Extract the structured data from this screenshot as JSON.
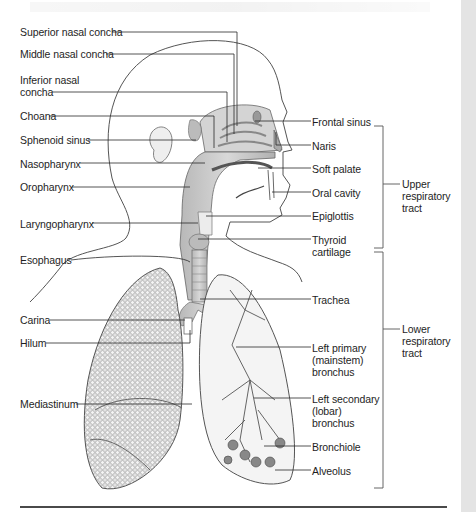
{
  "figure": {
    "left_labels": [
      {
        "id": "superior-nasal-concha",
        "text": "Superior nasal concha",
        "x": 20,
        "y": 26
      },
      {
        "id": "middle-nasal-concha",
        "text": "Middle nasal concha",
        "x": 20,
        "y": 48
      },
      {
        "id": "inferior-nasal-concha",
        "text": "Inferior nasal\nconcha",
        "x": 20,
        "y": 74
      },
      {
        "id": "choana",
        "text": "Choana",
        "x": 20,
        "y": 110
      },
      {
        "id": "sphenoid-sinus",
        "text": "Sphenoid sinus",
        "x": 20,
        "y": 134
      },
      {
        "id": "nasopharynx",
        "text": "Nasopharynx",
        "x": 20,
        "y": 158
      },
      {
        "id": "oropharynx",
        "text": "Oropharynx",
        "x": 20,
        "y": 181
      },
      {
        "id": "laryngopharynx",
        "text": "Laryngopharynx",
        "x": 20,
        "y": 218
      },
      {
        "id": "esophagus",
        "text": "Esophagus",
        "x": 20,
        "y": 254
      },
      {
        "id": "carina",
        "text": "Carina",
        "x": 20,
        "y": 314
      },
      {
        "id": "hilum",
        "text": "Hilum",
        "x": 20,
        "y": 337
      },
      {
        "id": "mediastinum",
        "text": "Mediastinum",
        "x": 20,
        "y": 398
      }
    ],
    "right_labels": [
      {
        "id": "frontal-sinus",
        "text": "Frontal sinus",
        "x": 312,
        "y": 116
      },
      {
        "id": "naris",
        "text": "Naris",
        "x": 312,
        "y": 140
      },
      {
        "id": "soft-palate",
        "text": "Soft palate",
        "x": 312,
        "y": 163
      },
      {
        "id": "oral-cavity",
        "text": "Oral cavity",
        "x": 312,
        "y": 187
      },
      {
        "id": "epiglottis",
        "text": "Epiglottis",
        "x": 312,
        "y": 210
      },
      {
        "id": "thyroid-cartilage",
        "text": "Thyroid\ncartilage",
        "x": 312,
        "y": 234
      },
      {
        "id": "trachea",
        "text": "Trachea",
        "x": 312,
        "y": 294
      },
      {
        "id": "left-primary-bronchus",
        "text": "Left primary\n(mainstem)\nbronchus",
        "x": 312,
        "y": 342
      },
      {
        "id": "left-secondary-bronchus",
        "text": "Left secondary\n(lobar)\nbronchus",
        "x": 312,
        "y": 393
      },
      {
        "id": "bronchiole",
        "text": "Bronchiole",
        "x": 312,
        "y": 441
      },
      {
        "id": "alveolus",
        "text": "Alveolus",
        "x": 312,
        "y": 465
      }
    ],
    "groups": [
      {
        "id": "upper-respiratory-tract",
        "text": "Upper\nrespiratory\ntract",
        "x": 402,
        "y": 178
      },
      {
        "id": "lower-respiratory-tract",
        "text": "Lower\nrespiratory\ntract",
        "x": 402,
        "y": 323
      }
    ],
    "colors": {
      "ink": "#1e1e1e",
      "leader": "#2a2a2a",
      "airway_fill": "#c8c8c8",
      "lung_fill": "#d6d6d6",
      "gutter": "#e4e4e4",
      "rule": "#4a4a4a"
    }
  }
}
